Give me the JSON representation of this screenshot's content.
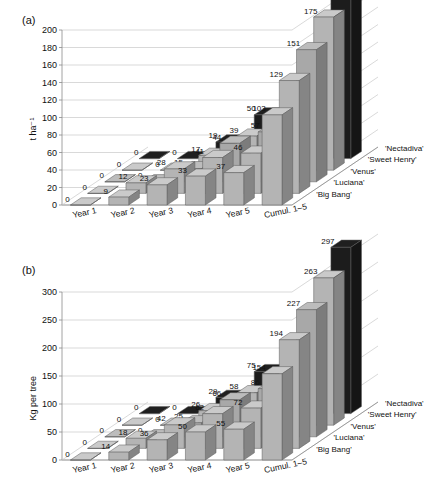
{
  "figure": {
    "panel_a_label": "(a)",
    "panel_b_label": "(b)"
  },
  "chart_data": [
    {
      "type": "bar",
      "title": "(a)",
      "xlabel": "",
      "ylabel": "t ha⁻¹",
      "ylim": [
        0,
        200
      ],
      "yticks": [
        0,
        20,
        40,
        60,
        80,
        100,
        120,
        140,
        160,
        180,
        200
      ],
      "categories": [
        "Year 1",
        "Year 2",
        "Year 3",
        "Year 4",
        "Year 5",
        "Cumul. 1–5"
      ],
      "series": [
        {
          "name": "'Big Bang'",
          "color": "#b4b4b4",
          "values": [
            0,
            9,
            23,
            33,
            37,
            103
          ]
        },
        {
          "name": "'Luciana'",
          "color": "#b4b4b4",
          "values": [
            0,
            12,
            28,
            41,
            46,
            129
          ]
        },
        {
          "name": "'Venus'",
          "color": "#a8a8a8",
          "values": [
            0,
            0,
            15,
            44,
            57,
            151
          ]
        },
        {
          "name": "'Sweet Henry'",
          "color": "#b4b4b4",
          "values": [
            0,
            0,
            17,
            39,
            55,
            175
          ]
        },
        {
          "name": "'Nectadiva'",
          "color": "#1c1c1c",
          "values": [
            0,
            0,
            19,
            50,
            61,
            198
          ]
        }
      ],
      "grid": true,
      "legend_position": "right-depth-axis",
      "legend": [
        "'Nectadiva'",
        "'Sweet Henry'",
        "'Venus'",
        "'Luciana'",
        "'Big Bang'"
      ]
    },
    {
      "type": "bar",
      "title": "(b)",
      "xlabel": "",
      "ylabel": "Kg per tree",
      "ylim": [
        0,
        300
      ],
      "yticks": [
        0,
        50,
        100,
        150,
        200,
        250,
        300
      ],
      "categories": [
        "Year 1",
        "Year 2",
        "Year 3",
        "Year 4",
        "Year 5",
        "Cumul. 1–5"
      ],
      "series": [
        {
          "name": "'Big Bang'",
          "color": "#b4b4b4",
          "values": [
            0,
            14,
            36,
            50,
            55,
            154
          ]
        },
        {
          "name": "'Luciana'",
          "color": "#b4b4b4",
          "values": [
            0,
            18,
            42,
            62,
            72,
            194
          ]
        },
        {
          "name": "'Venus'",
          "color": "#a8a8a8",
          "values": [
            0,
            0,
            25,
            66,
            86,
            227
          ]
        },
        {
          "name": "'Sweet Henry'",
          "color": "#b4b4b4",
          "values": [
            0,
            0,
            26,
            58,
            82,
            263
          ]
        },
        {
          "name": "'Nectadiva'",
          "color": "#1c1c1c",
          "values": [
            0,
            0,
            29,
            75,
            91,
            297
          ]
        }
      ],
      "grid": true,
      "legend_position": "right-depth-axis",
      "legend": [
        "'Nectadiva'",
        "'Sweet Henry'",
        "'Venus'",
        "'Luciana'",
        "'Big Bang'"
      ]
    }
  ],
  "labels": {
    "extra_values_a": {
      "year5_venus": "57",
      "year5_luciana": "46",
      "cumul_sweet_henry": "175"
    },
    "extra_values_b": {
      "year4_venus": "66",
      "year5_luciana": "72",
      "year5_venus": "86",
      "year5_sweet_henry": "97",
      "year5_nectadiva_alt": "102"
    }
  }
}
